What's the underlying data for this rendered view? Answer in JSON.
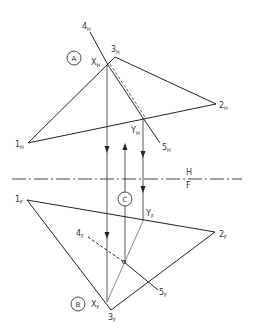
{
  "diagram": {
    "type": "descriptive-geometry-piercing-point",
    "fold_line": {
      "top_label": "H",
      "bottom_label": "F"
    },
    "circled_markers": [
      {
        "id": "A",
        "label": "A"
      },
      {
        "id": "B",
        "label": "B"
      },
      {
        "id": "C",
        "label": "C"
      }
    ],
    "horizontal_view": {
      "points": [
        {
          "id": "1H",
          "main": "1",
          "sub": "H"
        },
        {
          "id": "2H",
          "main": "2",
          "sub": "H"
        },
        {
          "id": "3H",
          "main": "3",
          "sub": "H"
        },
        {
          "id": "4H",
          "main": "4",
          "sub": "H"
        },
        {
          "id": "5H",
          "main": "5",
          "sub": "H"
        },
        {
          "id": "XH",
          "main": "X",
          "sub": "H"
        },
        {
          "id": "YH",
          "main": "Y",
          "sub": "H"
        }
      ]
    },
    "frontal_view": {
      "points": [
        {
          "id": "1F",
          "main": "1",
          "sub": "F"
        },
        {
          "id": "2F",
          "main": "2",
          "sub": "F"
        },
        {
          "id": "3F",
          "main": "3",
          "sub": "F"
        },
        {
          "id": "4F",
          "main": "4",
          "sub": "F"
        },
        {
          "id": "5F",
          "main": "5",
          "sub": "F"
        },
        {
          "id": "XF",
          "main": "X",
          "sub": "F"
        },
        {
          "id": "YF",
          "main": "Y",
          "sub": "F"
        }
      ]
    },
    "colors": {
      "line": "#222222",
      "projector": "#444444",
      "hidden": "#555555"
    }
  }
}
